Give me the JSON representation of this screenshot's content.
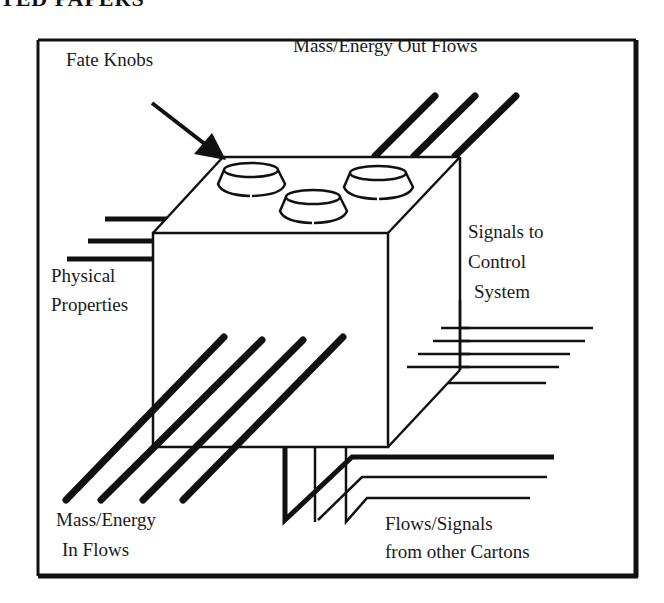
{
  "header": {
    "text": "TED PAPERS"
  },
  "diagram": {
    "labels": {
      "fate_knobs": "Fate Knobs",
      "out_flows": "Mass/Energy Out Flows",
      "signals_line1": "Signals to",
      "signals_line2": "Control",
      "signals_line3": "System",
      "physical_line1": "Physical",
      "physical_line2": "Properties",
      "in_flows_line1": "Mass/Energy",
      "in_flows_line2": "In Flows",
      "other_line1": "Flows/Signals",
      "other_line2": "from other Cartons"
    },
    "counts": {
      "fate_knobs": 3,
      "out_flow_lines": 3,
      "in_flow_lines": 4,
      "physical_property_lines": 3,
      "control_signal_lines": 5,
      "other_carton_lines": 3
    },
    "colors": {
      "ink": "#111111",
      "background": "#ffffff"
    }
  }
}
